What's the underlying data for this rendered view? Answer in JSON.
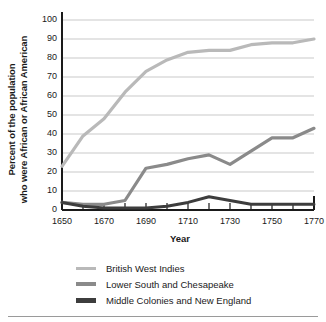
{
  "chart_data": {
    "type": "line",
    "title": "",
    "xlabel": "Year",
    "ylabel": "Percent of the population who were African or African American",
    "ylabel_line1": "Percent of the population",
    "ylabel_line2": "who were African or African American",
    "xlim": [
      1650,
      1770
    ],
    "ylim": [
      0,
      100
    ],
    "grid": true,
    "legend_position": "below",
    "x": [
      1650,
      1660,
      1670,
      1680,
      1690,
      1700,
      1710,
      1720,
      1730,
      1740,
      1750,
      1760,
      1770
    ],
    "xticks": [
      1650,
      1660,
      1670,
      1680,
      1690,
      1700,
      1710,
      1720,
      1730,
      1740,
      1750,
      1760,
      1770
    ],
    "xtick_labels": [
      "1650",
      "",
      "1670",
      "",
      "1690",
      "",
      "1710",
      "",
      "1730",
      "",
      "1750",
      "",
      "1770"
    ],
    "xtick_labels_shown": [
      "1650",
      "1670",
      "1690",
      "1710",
      "1730",
      "1750",
      "1770"
    ],
    "yticks": [
      0,
      10,
      20,
      30,
      40,
      50,
      60,
      70,
      80,
      90,
      100
    ],
    "ytick_labels": [
      "0",
      "10",
      "20",
      "30",
      "40",
      "50",
      "60",
      "70",
      "80",
      "90",
      "100"
    ],
    "series": [
      {
        "name": "British West Indies",
        "color": "#b9b9b9",
        "width": 3.2,
        "values": [
          23,
          39,
          48,
          62,
          73,
          79,
          83,
          84,
          84,
          87,
          88,
          88,
          90
        ]
      },
      {
        "name": "Lower South and Chesapeake",
        "color": "#8a8a8a",
        "width": 3.2,
        "values": [
          4,
          3,
          3,
          5,
          22,
          24,
          27,
          29,
          24,
          31,
          38,
          38,
          43
        ]
      },
      {
        "name": "Middle Colonies and New England",
        "color": "#3d3d3d",
        "width": 3.0,
        "values": [
          4,
          2,
          1,
          1,
          1,
          2,
          4,
          7,
          5,
          3,
          3,
          3,
          3
        ]
      }
    ]
  },
  "legend": {
    "items": [
      {
        "label": "British West Indies",
        "color": "#b9b9b9",
        "thickness": 3
      },
      {
        "label": "Lower South and Chesapeake",
        "color": "#8a8a8a",
        "thickness": 4
      },
      {
        "label": "Middle Colonies and New England",
        "color": "#3d3d3d",
        "thickness": 5
      }
    ]
  },
  "style": {
    "grid_color": "#c9c9c9",
    "axis_color": "#1a1a1a",
    "background": "#ffffff",
    "rule_color": "#9a9a9a"
  }
}
